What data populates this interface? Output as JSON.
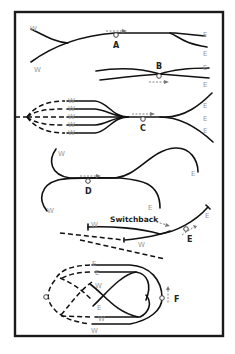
{
  "diagram": {
    "title": "",
    "frame": {
      "stroke": "#1a1a1a"
    },
    "panels": [
      {
        "id": "A",
        "label": "A",
        "directions": [
          "W",
          "W",
          "E",
          "E"
        ]
      },
      {
        "id": "B",
        "label": "B",
        "directions": [
          "E",
          "E"
        ]
      },
      {
        "id": "C",
        "label": "C",
        "directions": [
          "W",
          "W",
          "W",
          "W",
          "W",
          "E",
          "E",
          "E"
        ]
      },
      {
        "id": "D",
        "label": "D",
        "directions": [
          "W",
          "W",
          "E",
          "E"
        ]
      },
      {
        "id": "E",
        "label": "E",
        "directions": [
          "W",
          "W",
          "E"
        ],
        "annotation": "Switchback"
      },
      {
        "id": "F",
        "label": "F",
        "directions": [
          "E",
          "E",
          "W",
          "E",
          "W",
          "W"
        ]
      }
    ],
    "direction_labels": {
      "west": "W",
      "east": "E"
    },
    "colors": {
      "track": "#111111",
      "direction_label": "#999999",
      "movement_arrow": "#777777"
    }
  }
}
